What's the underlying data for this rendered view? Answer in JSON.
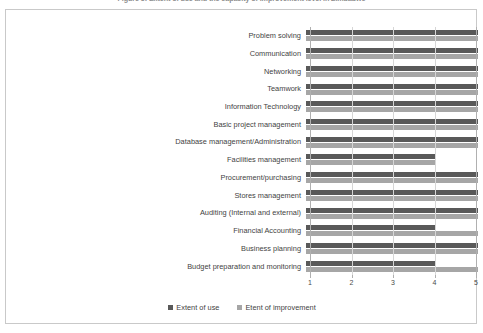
{
  "title": "Figure 5: Extent of use and the capacity of improvement level in Zimbabwe",
  "chart_data": {
    "type": "bar",
    "orientation": "horizontal",
    "title": "Figure 5: Extent of use and the capacity of improvement level in Zimbabwe",
    "xlabel": "",
    "ylabel": "",
    "xlim": [
      1,
      5
    ],
    "xticks": [
      "1",
      "2",
      "3",
      "4",
      "5"
    ],
    "grid": true,
    "legend_position": "bottom",
    "categories": [
      "Problem solving",
      "Communication",
      "Networking",
      "Teamwork",
      "Information Technology",
      "Basic project management",
      "Database management/Administration",
      "Facilities management",
      "Procurement/purchasing",
      "Stores management",
      "Auditing (Internal and external)",
      "Financial Accounting",
      "Business planning",
      "Budget preparation and monitoring"
    ],
    "series": [
      {
        "name": "Extent of use",
        "color": "#595959",
        "values": [
          5,
          5,
          5,
          5,
          5,
          5,
          5,
          4,
          5,
          5,
          5,
          4,
          5,
          4
        ]
      },
      {
        "name": "Etent of improvement",
        "color": "#a6a6a6",
        "values": [
          5,
          5,
          5,
          5,
          5,
          5,
          5,
          4,
          5,
          5,
          5,
          5,
          5,
          5
        ]
      }
    ]
  },
  "legend": {
    "items": [
      {
        "label": "Extent of use"
      },
      {
        "label": "Etent of improvement"
      }
    ]
  }
}
